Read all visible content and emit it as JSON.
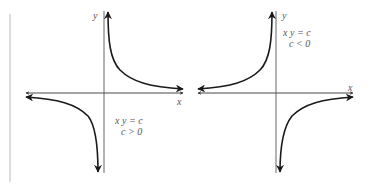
{
  "figure": {
    "left_panel": {
      "y_axis_label": "y",
      "x_axis_label": "x",
      "equation": "x y = c",
      "condition": "c > 0"
    },
    "right_panel": {
      "y_axis_label": "y",
      "x_axis_label": "x",
      "equation": "x y = c",
      "condition": "c < 0"
    }
  },
  "colors": {
    "curve": "#1a1a1a",
    "axis": "#333333",
    "border": "#bbbbbb",
    "text": "#555555"
  }
}
